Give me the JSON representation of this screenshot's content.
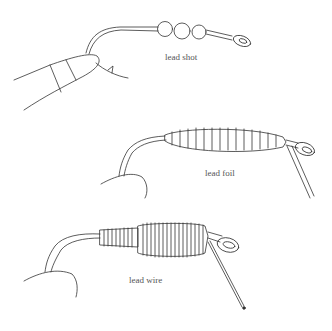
{
  "figures": [
    {
      "id": "lead-shot",
      "label": "lead shot"
    },
    {
      "id": "lead-foil",
      "label": "lead foil"
    },
    {
      "id": "lead-wire",
      "label": "lead wire"
    }
  ],
  "colors": {
    "line": "#333333",
    "background": "#ffffff",
    "label": "#555555"
  }
}
